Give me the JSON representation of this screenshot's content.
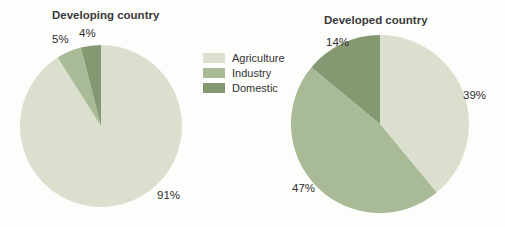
{
  "page": {
    "background": "#fdfdfc"
  },
  "legend": {
    "items": [
      {
        "label": "Agriculture",
        "color": "#dae0cd"
      },
      {
        "label": "Industry",
        "color": "#a9ba97"
      },
      {
        "label": "Domestic",
        "color": "#849972"
      }
    ]
  },
  "chart_data": [
    {
      "type": "pie",
      "title": "Developing country",
      "categories": [
        "Agriculture",
        "Industry",
        "Domestic"
      ],
      "values": [
        91,
        5,
        4
      ],
      "slice_labels": [
        "91%",
        "5%",
        "4%"
      ],
      "colors": [
        "#dae0cd",
        "#a9ba97",
        "#849972"
      ],
      "start_angle_deg": 0,
      "direction": "clockwise",
      "legend_position": "right-of-chart"
    },
    {
      "type": "pie",
      "title": "Developed country",
      "categories": [
        "Agriculture",
        "Industry",
        "Domestic"
      ],
      "values": [
        39,
        47,
        14
      ],
      "slice_labels": [
        "39%",
        "47%",
        "14%"
      ],
      "colors": [
        "#dae0cd",
        "#a9ba97",
        "#849972"
      ],
      "start_angle_deg": 0,
      "direction": "clockwise",
      "legend_position": "left-of-chart"
    }
  ]
}
